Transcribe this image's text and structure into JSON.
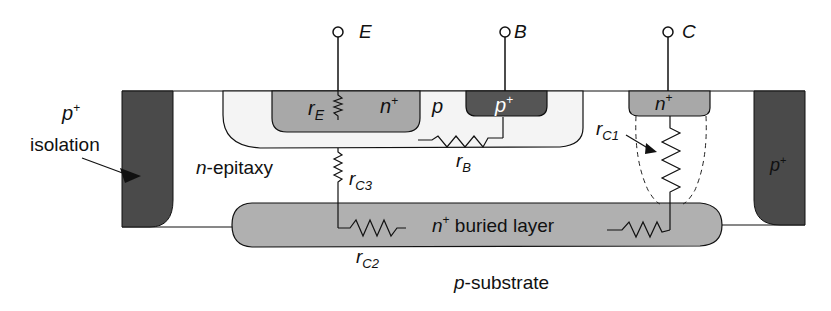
{
  "diagram": {
    "terminals": {
      "emitter": "E",
      "base": "B",
      "collector": "C"
    },
    "regions": {
      "isolation_left_label": "p",
      "isolation_left_sup": "+",
      "isolation_text": "isolation",
      "isolation_right_label": "p",
      "isolation_right_sup": "+",
      "emitter_label": "n",
      "emitter_sup": "+",
      "base_label": "p",
      "base_contact_label": "p",
      "base_contact_sup": "+",
      "collector_contact_label": "n",
      "collector_contact_sup": "+",
      "epitaxy_prefix": "n",
      "epitaxy_suffix": "-epitaxy",
      "buried_prefix": "n",
      "buried_sup": "+",
      "buried_suffix": " buried layer",
      "substrate_prefix": "p",
      "substrate_suffix": "-substrate"
    },
    "resistors": {
      "rE": {
        "r": "r",
        "sub": "E"
      },
      "rB": {
        "r": "r",
        "sub": "B"
      },
      "rC1": {
        "r": "r",
        "sub": "C1"
      },
      "rC2": {
        "r": "r",
        "sub": "C2"
      },
      "rC3": {
        "r": "r",
        "sub": "C3"
      }
    },
    "colors": {
      "isolation": "#4a4a4a",
      "base_contact": "#555555",
      "emitter": "#a8a8a8",
      "collector_contact": "#a8a8a8",
      "buried_layer": "#b0b0b0",
      "base_well": "#f4f4f4",
      "line": "#111111"
    }
  }
}
